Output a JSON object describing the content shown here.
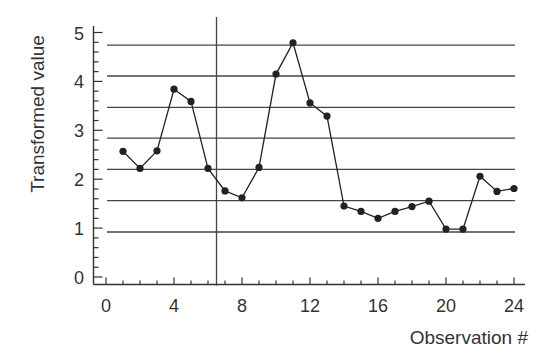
{
  "chart_data": {
    "type": "line",
    "title": "",
    "xlabel": "Observation #",
    "ylabel": "Transformed value",
    "xlim": [
      0,
      24
    ],
    "ylim": [
      0,
      5
    ],
    "x_ticks": [
      0,
      4,
      8,
      12,
      16,
      20,
      24
    ],
    "x_tick_labels": [
      "0",
      "4",
      "8",
      "12",
      "16",
      "20",
      "24"
    ],
    "x_minor_tick_step": 1,
    "y_ticks": [
      0,
      1,
      2,
      3,
      4,
      5
    ],
    "y_tick_labels": [
      "0",
      "1",
      "2",
      "3",
      "4",
      "5"
    ],
    "y_minor_tick_step": 0.2,
    "grid": false,
    "legend": null,
    "series": [
      {
        "name": "Transformed value",
        "marker": "filled-circle",
        "color": "#222222",
        "x": [
          1,
          2,
          3,
          4,
          5,
          6,
          7,
          8,
          9,
          10,
          11,
          12,
          13,
          14,
          15,
          16,
          17,
          18,
          19,
          20,
          21,
          22,
          23,
          24
        ],
        "values": [
          2.57,
          2.22,
          2.58,
          3.84,
          3.59,
          2.22,
          1.76,
          1.62,
          2.24,
          4.15,
          4.79,
          3.56,
          3.29,
          1.45,
          1.34,
          1.2,
          1.34,
          1.44,
          1.55,
          0.98,
          0.98,
          2.06,
          1.75,
          1.81
        ]
      }
    ],
    "reference_lines": {
      "horizontal": [
        4.74,
        4.11,
        3.47,
        2.84,
        2.2,
        1.56,
        0.92
      ],
      "vertical": [
        6.5
      ]
    }
  },
  "axes": {
    "x_title": "Observation #",
    "y_title": "Transformed value"
  },
  "colors": {
    "ink": "#222222",
    "axis": "#333333",
    "reference_line": "#444444",
    "background": "#ffffff"
  }
}
